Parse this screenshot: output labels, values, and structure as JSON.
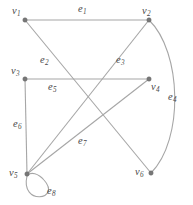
{
  "figure": {
    "type": "undirected-multigraph-diagram",
    "background_color": "#ffffff",
    "edge_color": "#a6a6a6",
    "vertex_color": "#777777",
    "label_color": "#4a4a4a"
  },
  "vertices": [
    {
      "id": "v1",
      "base": "v",
      "sub": "1",
      "x": 25,
      "y": 20,
      "label_x": 12,
      "label_y": 6,
      "label_anchor": "upper-left"
    },
    {
      "id": "v2",
      "base": "v",
      "sub": "2",
      "x": 149,
      "y": 20,
      "label_x": 142,
      "label_y": 6,
      "label_anchor": "upper-left"
    },
    {
      "id": "v3",
      "base": "v",
      "sub": "3",
      "x": 25,
      "y": 79,
      "label_x": 11,
      "label_y": 66,
      "label_anchor": "upper-left"
    },
    {
      "id": "v4",
      "base": "v",
      "sub": "4",
      "x": 149,
      "y": 79,
      "label_x": 151,
      "label_y": 82,
      "label_anchor": "lower-right"
    },
    {
      "id": "v5",
      "base": "v",
      "sub": "5",
      "x": 27,
      "y": 174,
      "label_x": 9,
      "label_y": 168,
      "label_anchor": "left"
    },
    {
      "id": "v6",
      "base": "v",
      "sub": "6",
      "x": 151,
      "y": 173,
      "label_x": 135,
      "label_y": 167,
      "label_anchor": "left"
    }
  ],
  "edges": [
    {
      "id": "e1",
      "base": "e",
      "sub": "1",
      "from": "v1",
      "to": "v2",
      "shape": "straight",
      "path": "M 25 20 L 149 20",
      "label_x": 78,
      "label_y": 4
    },
    {
      "id": "e2",
      "base": "e",
      "sub": "2",
      "from": "v1",
      "to": "v6",
      "shape": "straight",
      "path": "M 25 20 L 151 173",
      "label_x": 40,
      "label_y": 55
    },
    {
      "id": "e3",
      "base": "e",
      "sub": "3",
      "from": "v2",
      "to": "v5",
      "shape": "straight",
      "path": "M 149 20 L 27 174",
      "label_x": 116,
      "label_y": 55
    },
    {
      "id": "e4",
      "base": "e",
      "sub": "4",
      "from": "v2",
      "to": "v6",
      "shape": "arc",
      "path": "M 149 20 C 182 52 184 140 151 173",
      "label_x": 168,
      "label_y": 92
    },
    {
      "id": "e5",
      "base": "e",
      "sub": "5",
      "from": "v3",
      "to": "v4",
      "shape": "straight",
      "path": "M 25 79 L 149 79",
      "label_x": 48,
      "label_y": 82
    },
    {
      "id": "e6",
      "base": "e",
      "sub": "6",
      "from": "v3",
      "to": "v5",
      "shape": "straight",
      "path": "M 25 79 L 27 174",
      "label_x": 13,
      "label_y": 119
    },
    {
      "id": "e7",
      "base": "e",
      "sub": "7",
      "from": "v5",
      "to": "v4",
      "shape": "straight",
      "path": "M 27 174 L 149 79",
      "label_x": 78,
      "label_y": 136
    },
    {
      "id": "e8",
      "base": "e",
      "sub": "8",
      "from": "v5",
      "to": "v5",
      "shape": "self-loop",
      "path": "M 27 176 C 20 206 62 200 44 180 C 38 173 31 172 28 175 Z",
      "label_x": 47,
      "label_y": 186
    }
  ]
}
